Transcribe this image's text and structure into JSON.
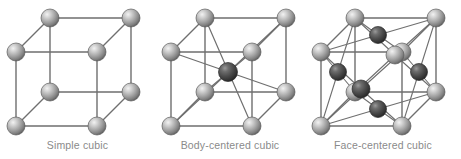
{
  "figure": {
    "background_color": "#ffffff",
    "width": 461,
    "height": 159
  },
  "style": {
    "edge_color": "#6f6f6f",
    "edge_width": 1.4,
    "caption_color": "#8a8a8a",
    "light_atom_color": "#a8a8a8",
    "light_atom_highlight": "#e8e8e8",
    "light_atom_rim": "#5a5a5a",
    "dark_atom_color": "#4a4a4a",
    "dark_atom_highlight": "#8e8e8e",
    "dark_atom_rim": "#2b2b2b",
    "atom_radius": 9,
    "atom_radius_small": 8
  },
  "cells": [
    {
      "id": "simple-cubic",
      "caption": "Simple cubic",
      "atom_count": 8,
      "corner_atoms": 8,
      "body_center_atoms": 0,
      "face_center_atoms": 0,
      "geometry": {
        "front_top_left": [
          16,
          52
        ],
        "front_top_right": [
          97,
          52
        ],
        "front_bottom_left": [
          16,
          126
        ],
        "front_bottom_right": [
          97,
          126
        ],
        "back_top_left": [
          50,
          18
        ],
        "back_top_right": [
          131,
          18
        ],
        "back_bottom_left": [
          50,
          92
        ],
        "back_bottom_right": [
          131,
          92
        ]
      }
    },
    {
      "id": "body-centered-cubic",
      "caption": "Body-centered cubic",
      "atom_count": 9,
      "corner_atoms": 8,
      "body_center_atoms": 1,
      "face_center_atoms": 0,
      "geometry": {
        "front_top_left": [
          16,
          52
        ],
        "front_top_right": [
          97,
          52
        ],
        "front_bottom_left": [
          16,
          126
        ],
        "front_bottom_right": [
          97,
          126
        ],
        "back_top_left": [
          50,
          18
        ],
        "back_top_right": [
          131,
          18
        ],
        "back_bottom_left": [
          50,
          92
        ],
        "back_bottom_right": [
          131,
          92
        ],
        "body_center": [
          73,
          72
        ]
      }
    },
    {
      "id": "face-centered-cubic",
      "caption": "Face-centered cubic",
      "atom_count": 14,
      "corner_atoms": 8,
      "body_center_atoms": 0,
      "face_center_atoms": 6,
      "geometry": {
        "front_top_left": [
          16,
          52
        ],
        "front_top_right": [
          97,
          52
        ],
        "front_bottom_left": [
          16,
          126
        ],
        "front_bottom_right": [
          97,
          126
        ],
        "back_top_left": [
          50,
          18
        ],
        "back_top_right": [
          131,
          18
        ],
        "back_bottom_left": [
          50,
          92
        ],
        "back_bottom_right": [
          131,
          92
        ],
        "face_front": [
          56,
          89
        ],
        "face_back": [
          90,
          55
        ],
        "face_left": [
          33,
          72
        ],
        "face_top": [
          73,
          35
        ],
        "face_right": [
          114,
          72
        ],
        "face_bottom": [
          73,
          109
        ]
      }
    }
  ]
}
